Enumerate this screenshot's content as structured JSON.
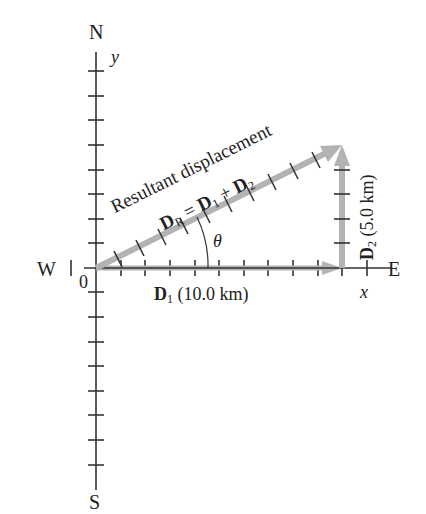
{
  "compass": {
    "north": "N",
    "south": "S",
    "west": "W",
    "east": "E"
  },
  "axes": {
    "x": "x",
    "y": "y",
    "origin": "0"
  },
  "angle_label": "θ",
  "resultant": {
    "caption": "Resultant displacement",
    "symbol": "D",
    "symbol_sub": "R",
    "eq_lhs_sub": "R",
    "eq": "=",
    "term1": "D",
    "term1_sub": "1",
    "plus": "+",
    "term2": "D",
    "term2_sub": "2"
  },
  "d1": {
    "symbol": "D",
    "sub": "1",
    "value": "(10.0 km)"
  },
  "d2": {
    "symbol": "D",
    "sub": "2",
    "value": "(5.0 km)"
  },
  "colors": {
    "axis": "#333333",
    "vector": "#b3b3b3",
    "text": "#222222"
  }
}
